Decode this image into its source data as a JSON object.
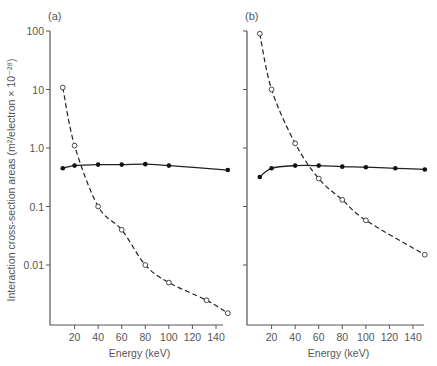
{
  "figure": {
    "ylabel": "Interaction cross-section areas (m²/electron × 10⁻²⁸)",
    "xlabel": "Energy (keV)"
  },
  "chart_data": [
    {
      "type": "line",
      "panel_label": "(a)",
      "xlabel": "Energy (keV)",
      "ylabel": "Interaction cross-section areas (m²/electron × 10⁻²⁸)",
      "yscale": "log",
      "ylim": [
        0.0012,
        100
      ],
      "xlim": [
        0,
        152
      ],
      "x_ticks": [
        20,
        40,
        60,
        80,
        100,
        120,
        140
      ],
      "y_ticks": [
        100,
        10,
        1.0,
        0.1,
        0.01
      ],
      "y_tick_labels": [
        "100",
        "10",
        "1.0",
        "0.1",
        "0.01"
      ],
      "grid": false,
      "series": [
        {
          "name": "filled (solid line)",
          "marker": "filled-circle",
          "line": "solid",
          "x": [
            10,
            20,
            40,
            60,
            80,
            100,
            150
          ],
          "values": [
            0.45,
            0.5,
            0.52,
            0.52,
            0.53,
            0.5,
            0.42
          ]
        },
        {
          "name": "open (dashed line)",
          "marker": "open-circle",
          "line": "dashed",
          "x": [
            10,
            20,
            40,
            60,
            80,
            100,
            132,
            150
          ],
          "values": [
            10.8,
            1.1,
            0.1,
            0.04,
            0.01,
            0.005,
            0.0025,
            0.0015
          ]
        }
      ]
    },
    {
      "type": "line",
      "panel_label": "(b)",
      "xlabel": "Energy (keV)",
      "ylabel": "Interaction cross-section areas (m²/electron × 10⁻²⁸)",
      "yscale": "log",
      "ylim": [
        0.0012,
        100
      ],
      "xlim": [
        0,
        152
      ],
      "x_ticks": [
        20,
        40,
        60,
        80,
        100,
        120,
        140
      ],
      "y_ticks": [
        100,
        10,
        1.0,
        0.1,
        0.01
      ],
      "y_tick_labels": [
        "",
        "",
        "",
        "",
        ""
      ],
      "grid": false,
      "series": [
        {
          "name": "filled (solid line)",
          "marker": "filled-circle",
          "line": "solid",
          "x": [
            10,
            20,
            40,
            60,
            80,
            100,
            125,
            150
          ],
          "values": [
            0.32,
            0.45,
            0.5,
            0.5,
            0.48,
            0.47,
            0.45,
            0.43
          ]
        },
        {
          "name": "open (dashed line)",
          "marker": "open-circle",
          "line": "dashed",
          "x": [
            10,
            20,
            40,
            60,
            80,
            100,
            150
          ],
          "values": [
            90,
            10,
            1.2,
            0.3,
            0.13,
            0.058,
            0.015
          ]
        }
      ]
    }
  ],
  "layout": {
    "panels": [
      {
        "x0": 51,
        "px_per_kev": 1.1786,
        "axis_x": 50,
        "axis_right": 223
      },
      {
        "x0": 248,
        "px_per_kev": 1.1786,
        "axis_x": 247,
        "axis_right": 424
      }
    ],
    "y_top": 31,
    "y_decade_px": 58.5,
    "y_bottom": 325
  }
}
